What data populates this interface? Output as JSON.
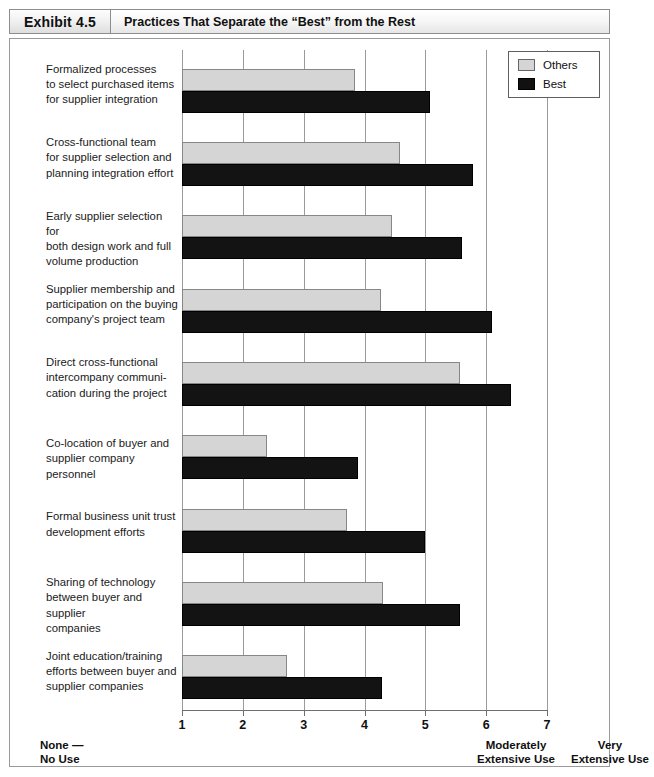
{
  "header": {
    "exhibit_tag": "Exhibit 4.5",
    "title": "Practices That Separate the “Best” from the Rest"
  },
  "legend": {
    "position": "top-right",
    "items": [
      {
        "label": "Others",
        "color": "#d5d5d5",
        "icon": "square-swatch-light"
      },
      {
        "label": "Best",
        "color": "#111111",
        "icon": "square-swatch-dark"
      }
    ]
  },
  "axis": {
    "ticks": [
      "1",
      "2",
      "3",
      "4",
      "5",
      "6",
      "7"
    ],
    "captions": {
      "low": "None —\nNo Use",
      "mid": "Moderately\nExtensive Use",
      "high": "Very\nExtensive Use"
    }
  },
  "chart_data": {
    "type": "bar",
    "orientation": "horizontal",
    "title": "Practices That Separate the “Best” from the Rest",
    "xlabel": "",
    "ylabel": "",
    "xlim": [
      1,
      7
    ],
    "xticks": [
      1,
      2,
      3,
      4,
      5,
      6,
      7
    ],
    "grid": true,
    "legend_position": "top-right",
    "categories": [
      "Formalized processes\nto select purchased items\nfor supplier integration",
      "Cross-functional team\nfor supplier selection and\nplanning integration effort",
      "Early supplier selection for\nboth design work and full\nvolume production",
      "Supplier membership and\nparticipation on the buying\ncompany's project team",
      "Direct cross-functional\nintercompany communi-\ncation during the project",
      "Co-location of buyer and\nsupplier company personnel",
      "Formal business unit trust\ndevelopment efforts",
      "Sharing of technology\nbetween buyer and supplier\ncompanies",
      "Joint education/training\nefforts between buyer and\nsupplier companies"
    ],
    "series": [
      {
        "name": "Others",
        "color": "#d5d5d5",
        "values": [
          3.85,
          4.58,
          4.45,
          4.27,
          5.57,
          2.4,
          3.72,
          4.3,
          2.73
        ]
      },
      {
        "name": "Best",
        "color": "#111111",
        "values": [
          5.07,
          5.78,
          5.6,
          6.1,
          6.4,
          3.9,
          5.0,
          5.57,
          4.28
        ]
      }
    ]
  }
}
